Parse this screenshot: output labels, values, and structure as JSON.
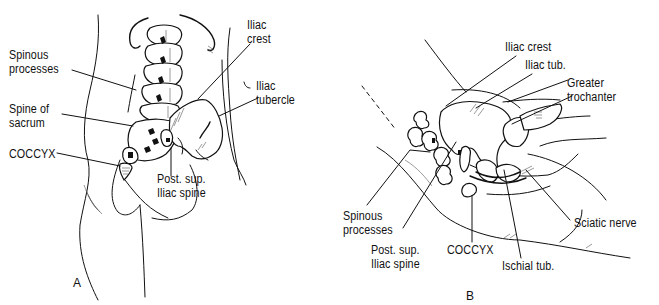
{
  "figure": {
    "panels": [
      {
        "id": "A",
        "letter": "A",
        "view": "posterior",
        "labels": {
          "spinous_processes": "Spinous\nprocesses",
          "spine_of_sacrum": "Spine of\nsacrum",
          "coccyx": "COCCYX",
          "iliac_crest": "Iliac\ncrest",
          "iliac_tubercle": "Iliac\ntubercle",
          "post_sup_iliac_spine": "Post. sup.\nIliac spine"
        }
      },
      {
        "id": "B",
        "letter": "B",
        "view": "lateral",
        "labels": {
          "iliac_crest": "Iliac crest",
          "iliac_tub": "Iliac tub.",
          "greater_trochanter": "Greater\ntrochanter",
          "spinous_processes": "Spinous\nprocesses",
          "post_sup_iliac_spine": "Post. sup.\nIliac spine",
          "coccyx": "COCCYX",
          "ischial_tub": "Ischial tub.",
          "sciatic_nerve": "Sciatic nerve"
        }
      }
    ],
    "colors": {
      "ink": "#111111",
      "background": "#ffffff"
    }
  }
}
